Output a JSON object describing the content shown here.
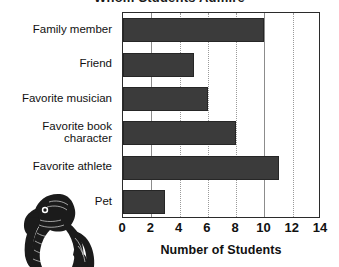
{
  "figure": {
    "title_fragment": "Whom Students Admire",
    "illustration_name": "bird-engraving-illustration"
  },
  "chart_data": {
    "type": "bar",
    "orientation": "horizontal",
    "title": "",
    "xlabel": "Number of Students",
    "ylabel": "",
    "categories": [
      "Family member",
      "Friend",
      "Favorite musician",
      "Favorite book\ncharacter",
      "Favorite athlete",
      "Pet"
    ],
    "values": [
      10,
      5,
      6,
      8,
      11,
      3
    ],
    "xlim": [
      0,
      14
    ],
    "xticks": [
      0,
      2,
      4,
      6,
      8,
      10,
      12,
      14
    ],
    "xtick_labels": [
      "0",
      "2",
      "4",
      "6",
      "8",
      "10",
      "12",
      "14"
    ],
    "grid": true,
    "grid_axis": "x",
    "legend": false,
    "bar_color": "#3b3b3b",
    "bar_edge_color": "#262626",
    "frame_color": "#2b2b2b",
    "grid_color": "#9a9a9a",
    "background": "#ffffff"
  }
}
